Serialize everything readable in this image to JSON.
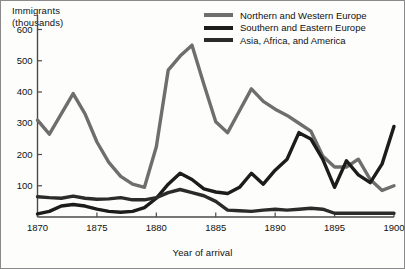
{
  "chart_data": {
    "type": "line",
    "title": "",
    "subtitle": "",
    "xlabel": "Year of arrival",
    "ylabel": "Immigrants (thousands)",
    "ylabel_line1": "Immigrants",
    "ylabel_line2": "(thousands)",
    "xlim": [
      1870,
      1900
    ],
    "ylim": [
      0,
      640
    ],
    "grid": false,
    "legend_position": "top-right",
    "x_tick_labels": [
      "1870",
      "1875",
      "1880",
      "1885",
      "1890",
      "1895",
      "1900"
    ],
    "x_ticks": [
      1870,
      1875,
      1880,
      1885,
      1890,
      1895,
      1900
    ],
    "y_tick_labels": [
      "100",
      "200",
      "300",
      "400",
      "500",
      "600"
    ],
    "y_ticks": [
      100,
      200,
      300,
      400,
      500,
      600
    ],
    "x": [
      1870,
      1871,
      1872,
      1873,
      1874,
      1875,
      1876,
      1877,
      1878,
      1879,
      1880,
      1881,
      1882,
      1883,
      1884,
      1885,
      1886,
      1887,
      1888,
      1889,
      1890,
      1891,
      1892,
      1893,
      1894,
      1895,
      1896,
      1897,
      1898,
      1899,
      1900
    ],
    "series": [
      {
        "name": "Northern and Western Europe",
        "color": "#6e6e6e",
        "values": [
          310,
          265,
          330,
          395,
          330,
          240,
          175,
          130,
          105,
          95,
          225,
          470,
          515,
          550,
          425,
          305,
          270,
          340,
          410,
          370,
          345,
          325,
          300,
          275,
          195,
          160,
          160,
          185,
          120,
          85,
          100
        ]
      },
      {
        "name": "Southern and Eastern Europe",
        "color": "#1c1c1c",
        "values": [
          10,
          18,
          35,
          40,
          35,
          25,
          18,
          15,
          18,
          30,
          60,
          105,
          140,
          120,
          90,
          80,
          75,
          95,
          140,
          105,
          150,
          185,
          270,
          250,
          185,
          95,
          180,
          135,
          110,
          170,
          290
        ]
      },
      {
        "name": "Asia, Africa, and America",
        "color": "#2b2b2b",
        "values": [
          65,
          62,
          60,
          67,
          60,
          57,
          58,
          62,
          55,
          55,
          62,
          78,
          88,
          78,
          68,
          50,
          22,
          20,
          18,
          22,
          25,
          22,
          25,
          28,
          25,
          12,
          12,
          12,
          12,
          12,
          12
        ]
      }
    ]
  },
  "legend": {
    "items": [
      {
        "label": "Northern and Western Europe",
        "color": "#6e6e6e"
      },
      {
        "label": "Southern and Eastern Europe",
        "color": "#1c1c1c"
      },
      {
        "label": "Asia, Africa, and America",
        "color": "#2b2b2b"
      }
    ]
  },
  "colors": {
    "axis": "#4a4a4a",
    "text": "#111111",
    "background": "#fdfdfc",
    "border": "#8a8a8a"
  }
}
